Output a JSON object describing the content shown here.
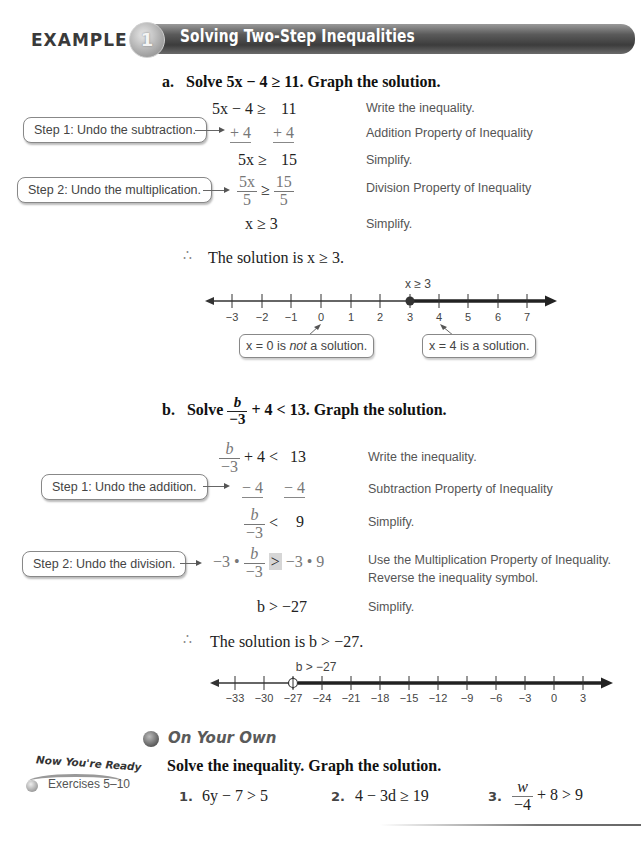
{
  "header": {
    "example_label": "EXAMPLE",
    "example_number": "1",
    "title": "Solving Two-Step Inequalities"
  },
  "part_a": {
    "label": "a.",
    "prompt_prefix": "Solve",
    "prompt_expr": "5x − 4 ≥ 11.",
    "prompt_suffix": "Graph the solution.",
    "rows": [
      {
        "left": "5x − 4 ≥",
        "right": "11",
        "note": "Write the inequality."
      },
      {
        "left": "+ 4",
        "right": "+ 4",
        "note": "Addition Property of Inequality"
      },
      {
        "left": "5x ≥",
        "right": "15",
        "note": "Simplify."
      },
      {
        "left_num": "5x",
        "left_den": "5",
        "op": "≥",
        "right_num": "15",
        "right_den": "5",
        "note": "Division Property of Inequality"
      },
      {
        "left": "x ≥ 3",
        "note": "Simplify."
      }
    ],
    "steps": [
      {
        "label": "Step 1:  Undo the subtraction."
      },
      {
        "label": "Step 2:  Undo the multiplication."
      }
    ],
    "conclusion": "The solution is x ≥ 3.",
    "number_line": {
      "ticks": [
        "−3",
        "−2",
        "−1",
        "0",
        "1",
        "2",
        "3",
        "4",
        "5",
        "6",
        "7"
      ],
      "label": "x ≥ 3",
      "point": "3",
      "point_type": "closed",
      "direction": "right"
    },
    "callouts": [
      {
        "pre": "x = 0 is ",
        "em": "not",
        "post": " a solution."
      },
      {
        "text": "x = 4 is a solution."
      }
    ]
  },
  "part_b": {
    "label": "b.",
    "prompt_prefix": "Solve",
    "prompt_num": "b",
    "prompt_den": "−3",
    "prompt_rest": "+ 4 < 13.",
    "prompt_suffix": "Graph the solution.",
    "rows": [
      {
        "num": "b",
        "den": "−3",
        "left_rest": "+ 4 <",
        "right": "13",
        "note": "Write the inequality."
      },
      {
        "left": "− 4",
        "right": "− 4",
        "note": "Subtraction Property of Inequality"
      },
      {
        "num": "b",
        "den": "−3",
        "left_rest": "<",
        "right": "9",
        "note": "Simplify."
      },
      {
        "pre": "−3 •",
        "num": "b",
        "den": "−3",
        "op": ">",
        "right": "−3 • 9",
        "note": "Use the Multiplication Property of Inequality.",
        "note2": "Reverse the inequality symbol."
      },
      {
        "left": "b > −27",
        "note": "Simplify."
      }
    ],
    "steps": [
      {
        "label": "Step 1:  Undo the addition."
      },
      {
        "label": "Step 2:  Undo the division."
      }
    ],
    "conclusion": "The solution is b > −27.",
    "number_line": {
      "ticks": [
        "−33",
        "−30",
        "−27",
        "−24",
        "−21",
        "−18",
        "−15",
        "−12",
        "−9",
        "−6",
        "−3",
        "0",
        "3"
      ],
      "label": "b > −27",
      "point": "−27",
      "point_type": "open",
      "direction": "right"
    }
  },
  "on_your_own": {
    "title": "On Your Own",
    "instruction": "Solve the inequality. Graph the solution.",
    "sidebar": {
      "title": "Now You're Ready",
      "exercises": "Exercises 5–10"
    },
    "exercises": [
      {
        "number": "1.",
        "expr": "6y − 7 > 5"
      },
      {
        "number": "2.",
        "expr": "4 − 3d ≥ 19"
      },
      {
        "number": "3.",
        "num": "w",
        "den": "−4",
        "rest": "+ 8 > 9"
      }
    ]
  }
}
